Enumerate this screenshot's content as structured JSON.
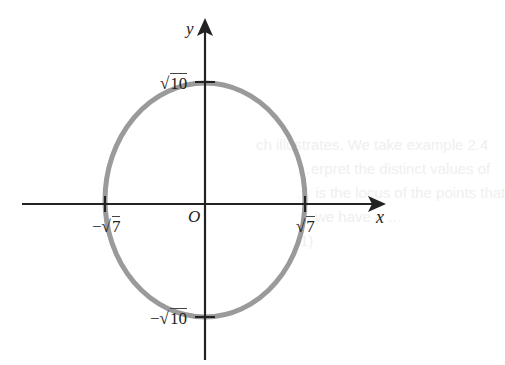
{
  "figure": {
    "axes": {
      "x_label": "x",
      "y_label": "y",
      "origin_label": "O"
    },
    "curve": {
      "type": "ellipse",
      "color": "#9a9a9a",
      "axis_color": "#222222"
    },
    "ticks": {
      "x_pos": {
        "sign": "",
        "radical": "√",
        "value": "7"
      },
      "x_neg": {
        "sign": "−",
        "radical": "√",
        "value": "7"
      },
      "y_pos": {
        "sign": "",
        "radical": "√",
        "value": "10"
      },
      "y_neg": {
        "sign": "−",
        "radical": "√",
        "value": "10"
      }
    }
  },
  "background_text": {
    "lines": [
      "ch illustrates. We take example 2.4",
      "…erpret the distinct values of",
      "… is the locus of the points that",
      "…we have a …",
      "1)"
    ]
  }
}
